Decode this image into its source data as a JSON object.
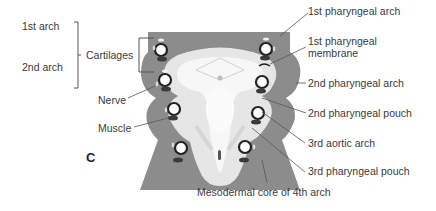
{
  "figure": {
    "panel_label": "C",
    "colors": {
      "mesoderm": "#8c8c8c",
      "mesoderm_dark": "#777777",
      "endoderm_light": "#e6e6e6",
      "endoderm_white": "#f7f7f7",
      "nerve_ring": "#222222",
      "muscle": "#3a3a3a",
      "leader": "#555555"
    },
    "left_labels": {
      "arch1": "1st arch",
      "arch2": "2nd arch",
      "cartilages": "Cartilages",
      "nerve": "Nerve",
      "muscle": "Muscle"
    },
    "right_labels": {
      "ph_arch1": "1st pharyngeal arch",
      "ph_membrane_line1": "1st pharyngeal",
      "ph_membrane_line2": "membrane",
      "ph_arch2": "2nd pharyngeal arch",
      "ph_pouch2": "2nd pharyngeal pouch",
      "aortic3": "3rd aortic arch",
      "ph_pouch3": "3rd pharyngeal pouch"
    },
    "bottom_labels": {
      "mesodermal_core": "Mesodermal core of 4th arch"
    }
  }
}
